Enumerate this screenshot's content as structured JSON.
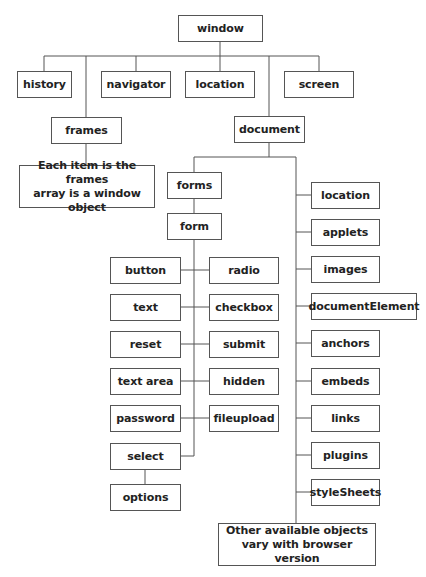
{
  "diagram": {
    "type": "object-hierarchy",
    "root": "window",
    "nodes": {
      "window": "window",
      "history": "history",
      "navigator": "navigator",
      "location_window": "location",
      "screen": "screen",
      "frames": "frames",
      "frames_note_line1": "Each item is the frames",
      "frames_note_line2": "array is a window object",
      "document": "document",
      "forms": "forms",
      "form": "form",
      "button": "button",
      "radio": "radio",
      "text": "text",
      "checkbox": "checkbox",
      "reset": "reset",
      "submit": "submit",
      "textarea": "text area",
      "hidden": "hidden",
      "password": "password",
      "fileupload": "fileupload",
      "select": "select",
      "options": "options",
      "location_document": "location",
      "applets": "applets",
      "images": "images",
      "documentElement": "documentElement",
      "anchors": "anchors",
      "embeds": "embeds",
      "links": "links",
      "plugins": "plugins",
      "styleSheets": "styleSheets",
      "other_line1": "Other available objects",
      "other_line2": "vary with browser version"
    },
    "edges": [
      [
        "window",
        "history"
      ],
      [
        "window",
        "frames"
      ],
      [
        "window",
        "navigator"
      ],
      [
        "window",
        "location"
      ],
      [
        "window",
        "document"
      ],
      [
        "window",
        "screen"
      ],
      [
        "frames",
        "frames_note"
      ],
      [
        "document",
        "forms"
      ],
      [
        "document",
        "location"
      ],
      [
        "document",
        "applets"
      ],
      [
        "document",
        "images"
      ],
      [
        "document",
        "documentElement"
      ],
      [
        "document",
        "anchors"
      ],
      [
        "document",
        "embeds"
      ],
      [
        "document",
        "links"
      ],
      [
        "document",
        "plugins"
      ],
      [
        "document",
        "styleSheets"
      ],
      [
        "document",
        "other"
      ],
      [
        "forms",
        "form"
      ],
      [
        "form",
        "button"
      ],
      [
        "form",
        "radio"
      ],
      [
        "form",
        "text"
      ],
      [
        "form",
        "checkbox"
      ],
      [
        "form",
        "reset"
      ],
      [
        "form",
        "submit"
      ],
      [
        "form",
        "text area"
      ],
      [
        "form",
        "hidden"
      ],
      [
        "form",
        "password"
      ],
      [
        "form",
        "fileupload"
      ],
      [
        "form",
        "select"
      ],
      [
        "select",
        "options"
      ]
    ]
  }
}
